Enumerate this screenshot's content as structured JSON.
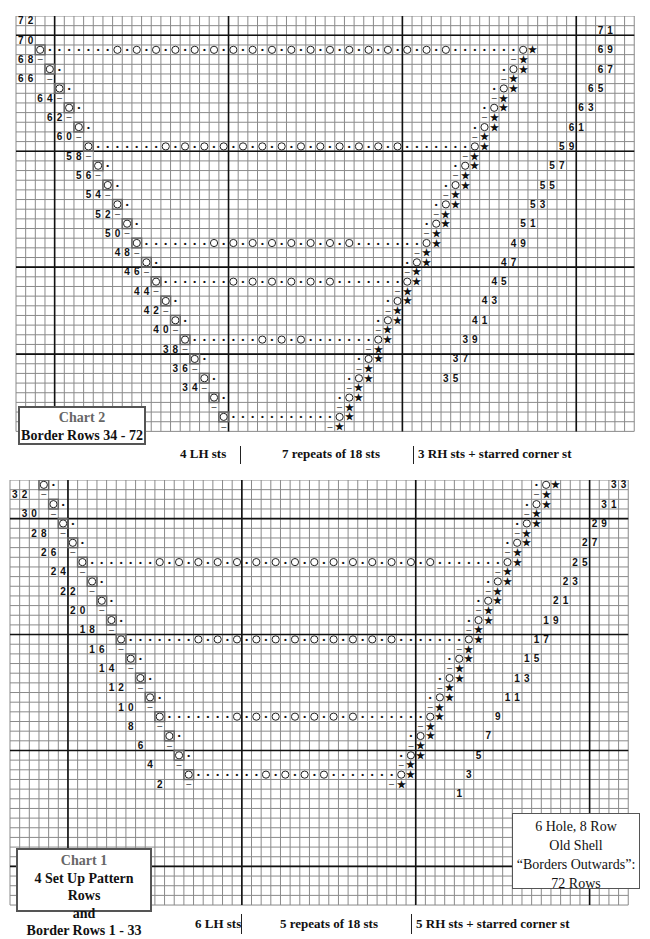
{
  "chart2": {
    "title": "Chart 2",
    "subtitle": "Border Rows 34 - 72",
    "footer": {
      "lh": "4 LH sts",
      "repeats": "7  repeats of 18 sts",
      "rh": "3 RH sts + starred corner st"
    },
    "left_row_numbers": [
      "72",
      "70",
      "68",
      "66",
      "64",
      "62",
      "60",
      "58",
      "56",
      "54",
      "52",
      "50",
      "48",
      "46",
      "44",
      "42",
      "40",
      "38",
      "36",
      "34"
    ],
    "right_row_numbers": [
      "71",
      "69",
      "67",
      "65",
      "63",
      "61",
      "59",
      "57",
      "55",
      "53",
      "51",
      "49",
      "47",
      "45",
      "43",
      "41",
      "39",
      "37",
      "35"
    ]
  },
  "chart1": {
    "title": "Chart 1",
    "subtitle_lines": [
      "4 Set Up Pattern Rows",
      "and",
      "Border Rows 1 - 33"
    ],
    "footer": {
      "lh": "6 LH sts",
      "repeats": "5  repeats of 18 sts",
      "rh": "5 RH sts + starred corner st"
    },
    "left_row_numbers": [
      "32",
      "30",
      "28",
      "26",
      "24",
      "22",
      "20",
      "18",
      "16",
      "14",
      "12",
      "10",
      "8",
      "6",
      "4",
      "2"
    ],
    "right_row_numbers": [
      "33",
      "31",
      "29",
      "27",
      "25",
      "23",
      "21",
      "19",
      "17",
      "15",
      "13",
      "11",
      "9",
      "7",
      "5",
      "3",
      "1"
    ]
  },
  "info_box": {
    "lines": [
      "6 Hole, 8 Row",
      "Old Shell",
      "“Borders Outwards”:",
      "72 Rows"
    ]
  },
  "symbols": {
    "yarn_over": "O",
    "purl": "•",
    "knit_dash": "–",
    "corner_star": "★",
    "k2tog": "/",
    "ssk": "\\"
  },
  "colors": {
    "grid_line": "#8a8a8a",
    "major_line": "#111111",
    "text": "#111111",
    "box_border": "#555555"
  }
}
